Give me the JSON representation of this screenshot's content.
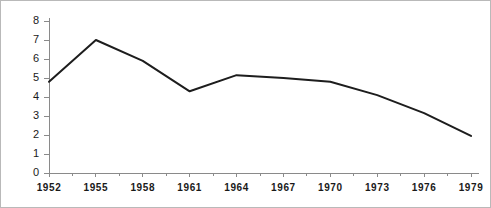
{
  "chart_data": {
    "type": "line",
    "title": "",
    "subtitle": "",
    "xlabel": "",
    "ylabel": "",
    "categories": [
      "1952",
      "1955",
      "1958",
      "1961",
      "1964",
      "1967",
      "1970",
      "1973",
      "1976",
      "1979"
    ],
    "x": [
      1952,
      1955,
      1958,
      1961,
      1964,
      1967,
      1970,
      1973,
      1976,
      1979
    ],
    "values": [
      4.8,
      7.0,
      5.9,
      4.3,
      5.15,
      5.0,
      4.8,
      4.1,
      3.15,
      1.95
    ],
    "series": [
      {
        "name": "",
        "values": [
          4.8,
          7.0,
          5.9,
          4.3,
          5.15,
          5.0,
          4.8,
          4.1,
          3.15,
          1.95
        ]
      }
    ],
    "ylim": [
      0,
      8
    ],
    "xlim": [
      1952,
      1979
    ],
    "ytick_labels": [
      "0",
      "1",
      "2",
      "3",
      "4",
      "5",
      "6",
      "7",
      "8"
    ],
    "ytick_values": [
      0,
      1,
      2,
      3,
      4,
      5,
      6,
      7,
      8
    ],
    "xtick_labels": [
      "1952",
      "1955",
      "1958",
      "1961",
      "1964",
      "1967",
      "1970",
      "1973",
      "1976",
      "1979"
    ],
    "grid": false,
    "legend": null,
    "legend_position": "none",
    "line_color": "#1d1d1d",
    "axis_color": "#8a8a8a",
    "background_color": "#ffffff",
    "annotations": []
  }
}
